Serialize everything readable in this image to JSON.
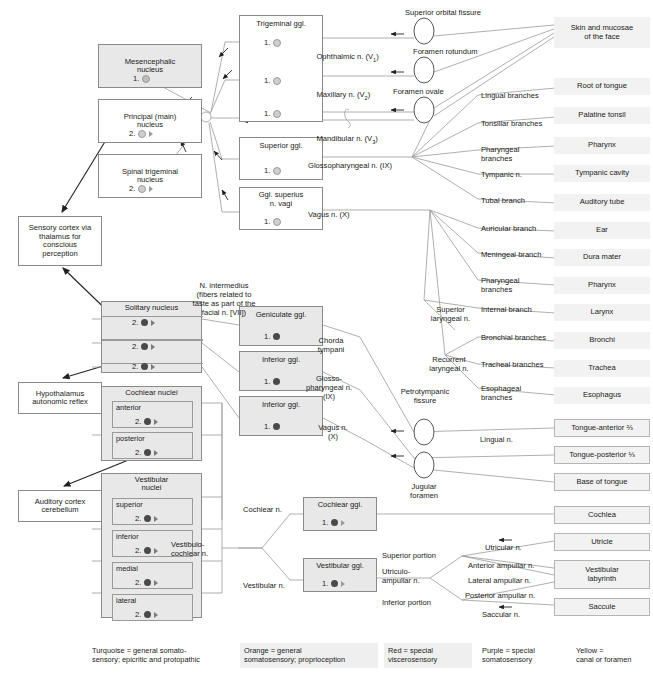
{
  "nuclei": [
    {
      "id": "mesencephalic",
      "label": "Mesencephalic\nnucleus",
      "neuron": "1.",
      "x": 98,
      "y": 44,
      "w": 104,
      "h": 44,
      "fill": "#e8e8e8"
    },
    {
      "id": "principal",
      "label": "Principal (main)\nnucleus",
      "neuron": "2.",
      "x": 98,
      "y": 99,
      "w": 104,
      "h": 44,
      "fill": "#ffffff"
    },
    {
      "id": "spinal-trigeminal",
      "label": "Spinal trigeminal\nnucleus",
      "neuron": "2.",
      "x": 98,
      "y": 154,
      "w": 104,
      "h": 44,
      "fill": "#ffffff"
    }
  ],
  "ganglia": [
    {
      "id": "trigeminal",
      "label": "Trigeminal ggl.",
      "neurons": [
        "1.",
        "1.",
        "1."
      ],
      "x": 239,
      "y": 15,
      "w": 84,
      "h": 107
    },
    {
      "id": "superior",
      "label": "Superior ggl.",
      "neurons": [
        "1."
      ],
      "x": 239,
      "y": 137,
      "w": 84,
      "h": 43
    },
    {
      "id": "ggl-superius-vagi",
      "label": "Ggl. superius\nn. vagi",
      "neurons": [
        "1."
      ],
      "x": 239,
      "y": 187,
      "w": 84,
      "h": 43
    },
    {
      "id": "geniculate",
      "label": "Geniculate ggl.",
      "neurons": [
        "1."
      ],
      "x": 239,
      "y": 306,
      "w": 84,
      "h": 40
    },
    {
      "id": "inferior-ix",
      "label": "Inferior ggl.",
      "neurons": [
        "1."
      ],
      "x": 239,
      "y": 351,
      "w": 84,
      "h": 40
    },
    {
      "id": "inferior-x",
      "label": "Inferior ggl.",
      "neurons": [
        "1."
      ],
      "x": 239,
      "y": 396,
      "w": 84,
      "h": 40
    },
    {
      "id": "cochlear-ggl",
      "label": "Cochlear ggl.",
      "neurons": [
        "1."
      ],
      "x": 303,
      "y": 497,
      "w": 74,
      "h": 34
    },
    {
      "id": "vestibular-ggl",
      "label": "Vestibular ggl.",
      "neurons": [
        "1."
      ],
      "x": 303,
      "y": 558,
      "w": 74,
      "h": 34
    }
  ],
  "cns_targets": [
    {
      "id": "sensory-cortex",
      "label": "Sensory cortex via\nthalamus for\nconscious\nperception",
      "x": 18,
      "y": 216,
      "w": 84,
      "h": 50
    },
    {
      "id": "hypothalamus",
      "label": "Hypothalamus\nautonomic reflex",
      "x": 18,
      "y": 382,
      "w": 84,
      "h": 32
    },
    {
      "id": "auditory-cortex",
      "label": "Auditory cortex\ncerebellum",
      "x": 18,
      "y": 490,
      "w": 84,
      "h": 32
    }
  ],
  "solitary": {
    "header": "Solitary nucleus",
    "x": 101,
    "y": 301,
    "w": 101,
    "h": 72,
    "neurons": [
      "2.",
      "2.",
      "2."
    ]
  },
  "cochlear_nuclei": {
    "header": "Cochlear nuclei",
    "x": 101,
    "y": 386,
    "w": 101,
    "h": 75,
    "subs": [
      {
        "label": "anterior",
        "neuron": "2."
      },
      {
        "label": "posterior",
        "neuron": "2."
      }
    ]
  },
  "vestibular_nuclei": {
    "header": "Vestibular\nnuclei",
    "x": 101,
    "y": 473,
    "w": 101,
    "h": 145,
    "subs": [
      {
        "label": "superior",
        "neuron": "2."
      },
      {
        "label": "inferior",
        "neuron": "2."
      },
      {
        "label": "medial",
        "neuron": "2."
      },
      {
        "label": "lateral",
        "neuron": "2."
      }
    ]
  },
  "nerve_labels": [
    {
      "id": "ophthalmic",
      "text": "Ophthalmic n. (V",
      "sub": "1",
      "tail": ")",
      "x": 308,
      "y": 44
    },
    {
      "id": "maxillary",
      "text": "Maxillary n. (V",
      "sub": "2",
      "tail": ")",
      "x": 308,
      "y": 82
    },
    {
      "id": "mandibular",
      "text": "Mandibular n. (V",
      "sub": "3",
      "tail": ")",
      "x": 308,
      "y": 126
    },
    {
      "id": "glossopharyngeal",
      "text": "Glossopharyngeal n. (IX)",
      "x": 308,
      "y": 162
    },
    {
      "id": "vagus",
      "text": "Vagus n. (X)",
      "x": 308,
      "y": 211
    },
    {
      "id": "n-intermedius",
      "text": "N. intermedius\n(fibers related to\ntaste as part of the\nfacial n. [VII])",
      "x": 163,
      "y": 282,
      "align": "center",
      "w": 122
    },
    {
      "id": "chorda-tympani",
      "text": "Chorda\ntympani",
      "x": 307,
      "y": 337,
      "align": "center",
      "w": 48
    },
    {
      "id": "glosso-ix",
      "text": "Glosso-\npharyngeal n.\n(IX)",
      "x": 296,
      "y": 375,
      "align": "center",
      "w": 66
    },
    {
      "id": "vagus-x-2",
      "text": "Vagus n.\n(X)",
      "x": 311,
      "y": 424,
      "align": "center",
      "w": 44
    },
    {
      "id": "cochlear-n",
      "text": "Cochlear n.",
      "x": 243,
      "y": 513
    },
    {
      "id": "vestibular-n",
      "text": "Vestibular n.",
      "x": 243,
      "y": 589
    },
    {
      "id": "vestibulocochlear-n",
      "text": "Vestibulo-\ncochlear n.",
      "x": 171,
      "y": 548,
      "align": "left",
      "w": 60
    }
  ],
  "branch_labels": [
    {
      "id": "lingual-branches",
      "text": "Lingual branches",
      "x": 481,
      "y": 99
    },
    {
      "id": "tonsillar-branches",
      "text": "Tonsillar branches",
      "x": 481,
      "y": 127
    },
    {
      "id": "pharyngeal-branches-ix",
      "text": "Pharyngeal\nbranches",
      "x": 481,
      "y": 150
    },
    {
      "id": "tympanic-n",
      "text": "Tympanic n.",
      "x": 481,
      "y": 177
    },
    {
      "id": "tubal-branch",
      "text": "Tubal branch",
      "x": 481,
      "y": 203
    },
    {
      "id": "auricular-branch",
      "text": "Auricular branch",
      "x": 481,
      "y": 231
    },
    {
      "id": "meningeal-branch",
      "text": "Meningeal branch",
      "x": 481,
      "y": 257
    },
    {
      "id": "pharyngeal-branches-x",
      "text": "Pharyngeal\nbranches",
      "x": 481,
      "y": 281
    },
    {
      "id": "internal-branch",
      "text": "Internal branch",
      "x": 481,
      "y": 311
    },
    {
      "id": "bronchial-branches",
      "text": "Bronchial branches",
      "x": 481,
      "y": 340
    },
    {
      "id": "tracheal-branches",
      "text": "Tracheal branches",
      "x": 481,
      "y": 367
    },
    {
      "id": "esophageal-branches",
      "text": "Esophageal\nbranches",
      "x": 481,
      "y": 389
    },
    {
      "id": "superior-laryngeal-n",
      "text": "Superior\nlaryngeal n.",
      "x": 424,
      "y": 311,
      "align": "center",
      "w": 53
    },
    {
      "id": "recurrent-laryngeal-n",
      "text": "Recurrent\nlaryngeal n.",
      "x": 421,
      "y": 361,
      "align": "center",
      "w": 56
    },
    {
      "id": "lingual-n",
      "text": "Lingual n.",
      "x": 480,
      "y": 438
    },
    {
      "id": "utricular-n",
      "text": "Utricular n.",
      "x": 485,
      "y": 544
    },
    {
      "id": "anterior-ampullar-n",
      "text": "Anterior ampullar n.",
      "x": 468,
      "y": 564
    },
    {
      "id": "lateral-ampullar-n",
      "text": "Lateral ampullar n.",
      "x": 468,
      "y": 579
    },
    {
      "id": "posterior-ampullar-n",
      "text": "Posterior ampullar n.",
      "x": 465,
      "y": 594
    },
    {
      "id": "saccular-n",
      "text": "Saccular n.",
      "x": 482,
      "y": 611
    },
    {
      "id": "superior-portion",
      "text": "Superior portion",
      "x": 382,
      "y": 556
    },
    {
      "id": "inferior-portion",
      "text": "Inferior portion",
      "x": 382,
      "y": 603
    },
    {
      "id": "utriculo-ampullar-n",
      "text": "Utriculo-\nampullar n.",
      "x": 382,
      "y": 571
    }
  ],
  "foramina": [
    {
      "id": "superior-orbital-fissure",
      "text": "Superior orbital fissure",
      "cx": 424,
      "cy": 31,
      "tx": 408,
      "ty": 11,
      "align": "left"
    },
    {
      "id": "foramen-rotundum",
      "text": "Foramen rotundum",
      "cx": 424,
      "cy": 70,
      "tx": 413,
      "ty": 48,
      "align": "left"
    },
    {
      "id": "foramen-ovale",
      "text": "Foramen ovale",
      "cx": 424,
      "cy": 110,
      "tx": 393,
      "ty": 90,
      "align": "left"
    },
    {
      "id": "petrotympanic-fissure",
      "text": "Petrotympanic\nfissure",
      "cx": 424,
      "cy": 432,
      "tx": 392,
      "ty": 389,
      "align": "center"
    },
    {
      "id": "jugular-foramen",
      "text": "Jugular\nforamen",
      "cx": 424,
      "cy": 465,
      "tx": 400,
      "ty": 485,
      "align": "center"
    }
  ],
  "targets": [
    {
      "id": "skin-face",
      "text": "Skin and mucosae\nof the face",
      "x": 554,
      "y": 17,
      "w": 96,
      "h": 31,
      "boxed": false
    },
    {
      "id": "root-of-tongue",
      "text": "Root of tongue",
      "x": 554,
      "y": 78,
      "w": 96,
      "h": 17,
      "boxed": false
    },
    {
      "id": "palatine-tonsil",
      "text": "Palatine tonsil",
      "x": 554,
      "y": 107,
      "w": 96,
      "h": 17,
      "boxed": false
    },
    {
      "id": "pharynx-1",
      "text": "Pharynx",
      "x": 554,
      "y": 137,
      "w": 96,
      "h": 17,
      "boxed": false
    },
    {
      "id": "tympanic-cavity",
      "text": "Tympanic cavity",
      "x": 554,
      "y": 165,
      "w": 96,
      "h": 17,
      "boxed": false
    },
    {
      "id": "auditory-tube",
      "text": "Auditory tube",
      "x": 554,
      "y": 194,
      "w": 96,
      "h": 17,
      "boxed": false
    },
    {
      "id": "ear",
      "text": "Ear",
      "x": 554,
      "y": 222,
      "w": 96,
      "h": 17,
      "boxed": false
    },
    {
      "id": "dura-mater",
      "text": "Dura mater",
      "x": 554,
      "y": 249,
      "w": 96,
      "h": 17,
      "boxed": false
    },
    {
      "id": "pharynx-2",
      "text": "Pharynx",
      "x": 554,
      "y": 277,
      "w": 96,
      "h": 17,
      "boxed": false
    },
    {
      "id": "larynx",
      "text": "Larynx",
      "x": 554,
      "y": 304,
      "w": 96,
      "h": 17,
      "boxed": false
    },
    {
      "id": "bronchi",
      "text": "Bronchi",
      "x": 554,
      "y": 332,
      "w": 96,
      "h": 17,
      "boxed": false
    },
    {
      "id": "trachea",
      "text": "Trachea",
      "x": 554,
      "y": 360,
      "w": 96,
      "h": 17,
      "boxed": false
    },
    {
      "id": "esophagus",
      "text": "Esophagus",
      "x": 554,
      "y": 387,
      "w": 96,
      "h": 17,
      "boxed": false
    },
    {
      "id": "tongue-anterior",
      "text": "Tongue-anterior ⅔",
      "x": 554,
      "y": 419,
      "w": 96,
      "h": 18,
      "boxed": true
    },
    {
      "id": "tongue-posterior",
      "text": "Tongue-posterior ⅓",
      "x": 554,
      "y": 446,
      "w": 96,
      "h": 18,
      "boxed": true
    },
    {
      "id": "base-of-tongue",
      "text": "Base of tongue",
      "x": 554,
      "y": 473,
      "w": 96,
      "h": 18,
      "boxed": true
    },
    {
      "id": "cochlea",
      "text": "Cochlea",
      "x": 554,
      "y": 506,
      "w": 96,
      "h": 18,
      "boxed": true
    },
    {
      "id": "utricle",
      "text": "Utricle",
      "x": 554,
      "y": 533,
      "w": 96,
      "h": 18,
      "boxed": true
    },
    {
      "id": "vestibular-labyrinth",
      "text": "Vestibular\nlabyrinth",
      "x": 554,
      "y": 560,
      "w": 96,
      "h": 29,
      "boxed": true
    },
    {
      "id": "saccule",
      "text": "Saccule",
      "x": 554,
      "y": 598,
      "w": 96,
      "h": 18,
      "boxed": true
    }
  ],
  "legend": [
    {
      "id": "turquoise",
      "text": "Turquoise = general somato-\nsensory; epicritic and protopathic",
      "x": 88,
      "y": 643,
      "w": 140
    },
    {
      "id": "orange",
      "text": "Orange = general\nsomatosensory; proprioception",
      "x": 240,
      "y": 643,
      "w": 135
    },
    {
      "id": "red",
      "text": "Red = special\nviscerosensory",
      "x": 384,
      "y": 643,
      "w": 85
    },
    {
      "id": "purple",
      "text": "Purple = special\nsomatosensory",
      "x": 478,
      "y": 643,
      "w": 85
    },
    {
      "id": "yellow",
      "text": "Yellow =\ncanal or foramen",
      "x": 572,
      "y": 643,
      "w": 80
    }
  ],
  "colors": {
    "box_border": "#8a8a8a",
    "fill_gray": "#e8e8e8",
    "target_fill": "#f2f2f2",
    "line": "#9a9a9a",
    "text": "#1a1a1a"
  }
}
